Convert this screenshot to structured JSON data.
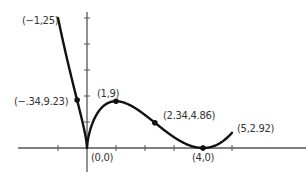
{
  "chart_data": {
    "type": "line",
    "title": "",
    "xlabel": "",
    "ylabel": "",
    "function": "f(x) = x^(2/3) (x - 4)^2",
    "domain": [
      -1,
      5
    ],
    "xlim": [
      -2.3,
      7.5
    ],
    "ylim": [
      -6,
      26
    ],
    "grid": false,
    "x_ticks": [
      -1,
      1,
      2,
      3,
      4,
      5
    ],
    "y_ticks": [
      5,
      10,
      15,
      20,
      25
    ],
    "series": [
      {
        "name": "f(x)",
        "x": [
          -1,
          -0.75,
          -0.5,
          -0.34,
          -0.2,
          -0.1,
          0,
          0.1,
          0.3,
          0.5,
          0.75,
          1,
          1.33,
          1.6,
          2,
          2.34,
          2.75,
          3,
          3.5,
          4,
          4.5,
          5
        ],
        "y": [
          25,
          18.55,
          12.6,
          9.23,
          6.15,
          3.58,
          0,
          3.26,
          6.14,
          7.72,
          8.72,
          9,
          8.71,
          7.93,
          6.35,
          4.86,
          3.07,
          2.08,
          0.57,
          0,
          0.68,
          2.92
        ]
      }
    ],
    "points": [
      {
        "x": -1,
        "y": 25,
        "label": "(−1,25)",
        "marker": false
      },
      {
        "x": -0.34,
        "y": 9.23,
        "label": "(−.34,9.23)",
        "marker": true
      },
      {
        "x": 0,
        "y": 0,
        "label": "(0,0)",
        "marker": false
      },
      {
        "x": 1,
        "y": 9,
        "label": "(1,9)",
        "marker": true
      },
      {
        "x": 2.34,
        "y": 4.86,
        "label": "(2.34,4.86)",
        "marker": true
      },
      {
        "x": 4,
        "y": 0,
        "label": "(4,0)",
        "marker": true
      },
      {
        "x": 5,
        "y": 2.92,
        "label": "(5,2.92)",
        "marker": false
      }
    ]
  },
  "style": {
    "curve_color": "#111111",
    "axis_color": "#555555",
    "label_color": "#333333"
  }
}
